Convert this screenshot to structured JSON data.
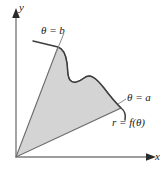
{
  "figure": {
    "axes": {
      "y_label": "y",
      "x_label": "x",
      "origin_label": "O"
    },
    "labels": {
      "theta_b": "θ = b",
      "theta_a": "θ = a",
      "curve": "r = f(θ)"
    },
    "colors": {
      "region_fill": "#d4d4d4",
      "region_stroke": "#6b6b6b",
      "curve_stroke": "#3d3d3d",
      "axis_stroke": "#7d7d7d",
      "text": "#1a1a1a"
    },
    "geometry": {
      "origin": [
        16,
        157
      ],
      "theta_b_ray_end": [
        58,
        47
      ],
      "theta_a_ray_end": [
        121,
        108
      ],
      "curve_description": "wavy S-curve from upper-left to right tip"
    }
  }
}
